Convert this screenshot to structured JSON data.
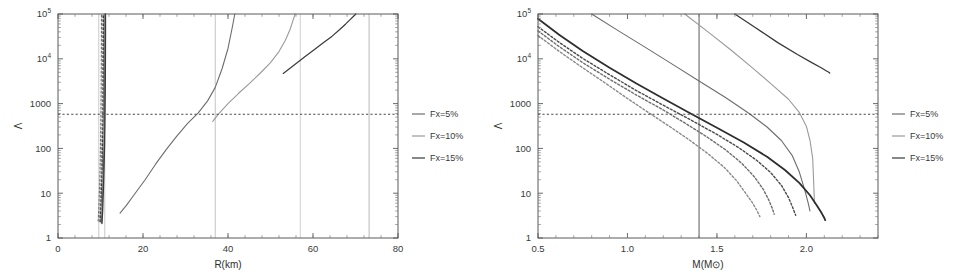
{
  "figure": {
    "background": "#ffffff",
    "panel_count": 2
  },
  "colors": {
    "fx5": "#6d6d6d",
    "fx10": "#9a9a9a",
    "fx15": "#3a3a3a",
    "frame": "#5a5a5a",
    "threshold": "#4a4a4a",
    "vline_faint": "#b5b5b5"
  },
  "legend": {
    "position": "right",
    "entries": [
      {
        "label": "Fx=5%",
        "color": "#6d6d6d"
      },
      {
        "label": "Fx=10%",
        "color": "#9a9a9a"
      },
      {
        "label": "Fx=15%",
        "color": "#3a3a3a"
      }
    ]
  },
  "chart_data": [
    {
      "type": "line",
      "panel": "left",
      "title": "",
      "xlabel": "R(km)",
      "ylabel": "Λ",
      "xlim": [
        0,
        80
      ],
      "ylim": [
        1,
        100000
      ],
      "yscale": "log",
      "xscale": "linear",
      "xticks": [
        0,
        20,
        40,
        60,
        80
      ],
      "xtick_labels": [
        "0",
        "20",
        "40",
        "60",
        "80"
      ],
      "yticks": [
        1,
        10,
        100,
        1000,
        10000,
        100000
      ],
      "ytick_labels": [
        "1",
        "10",
        "100",
        "1000",
        "10⁴",
        "10⁵"
      ],
      "grid": false,
      "annotations": {
        "threshold_line": {
          "y": 580,
          "style": "dotted",
          "label": "Λ=580"
        },
        "vertical_lines": [
          {
            "x": 9.6,
            "color": "#c2c2c2"
          },
          {
            "x": 11.0,
            "color": "#c2c2c2"
          },
          {
            "x": 37.0,
            "color": "#bdbdbd"
          },
          {
            "x": 57.0,
            "color": "#cccccc"
          },
          {
            "x": 73.2,
            "color": "#b0b0b0"
          }
        ]
      },
      "series": [
        {
          "name": "Fx=5% solid",
          "color": "#6d6d6d",
          "style": "solid",
          "width": 1.1,
          "x": [
            14.6,
            16.0,
            18.0,
            20.5,
            23.0,
            25.5,
            28.0,
            30.5,
            33.0,
            35.2,
            37.0,
            38.6,
            40.0,
            41.0,
            41.6
          ],
          "y": [
            3.6,
            5.2,
            9.5,
            20,
            45,
            95,
            190,
            360,
            620,
            1150,
            2300,
            6000,
            17000,
            50000,
            100000
          ]
        },
        {
          "name": "Fx=10% solid",
          "color": "#9a9a9a",
          "style": "solid",
          "width": 1.1,
          "x": [
            36.4,
            38.0,
            40.0,
            42.5,
            45.0,
            47.5,
            50.0,
            52.0,
            53.5,
            54.6,
            55.3,
            55.8
          ],
          "y": [
            400,
            620,
            1000,
            1700,
            2800,
            4700,
            8200,
            14500,
            26000,
            45000,
            72000,
            100000
          ]
        },
        {
          "name": "Fx=15% solid",
          "color": "#3a3a3a",
          "style": "solid",
          "width": 1.2,
          "x": [
            53.0,
            55.5,
            58.0,
            60.5,
            62.5,
            64.5,
            66.3,
            67.7,
            68.8,
            69.6,
            70.1
          ],
          "y": [
            4700,
            7200,
            11000,
            16500,
            23000,
            32000,
            45000,
            60000,
            76000,
            90000,
            100000
          ]
        },
        {
          "name": "Fx=5% compact branch",
          "color": "#6d6d6d",
          "style": "solid",
          "width": 1.2,
          "x": [
            10.2,
            10.35,
            10.5,
            10.65,
            10.8,
            10.9,
            10.95,
            10.98,
            11.0,
            11.0
          ],
          "y": [
            2.2,
            4,
            10,
            30,
            110,
            500,
            2200,
            11000,
            45000,
            100000
          ]
        },
        {
          "name": "Fx=10% compact branch",
          "color": "#9a9a9a",
          "style": "solid",
          "width": 1.0,
          "x": [
            10.0,
            10.15,
            10.3,
            10.45,
            10.6,
            10.7,
            10.76,
            10.8,
            10.82,
            10.82
          ],
          "y": [
            2.3,
            4.2,
            10.5,
            32,
            115,
            520,
            2300,
            11500,
            46000,
            100000
          ]
        },
        {
          "name": "Fx=15% compact branch",
          "color": "#3a3a3a",
          "style": "solid",
          "width": 1.3,
          "x": [
            10.35,
            10.5,
            10.65,
            10.8,
            10.95,
            11.05,
            11.12,
            11.16,
            11.18,
            11.18
          ],
          "y": [
            2.1,
            3.9,
            9.8,
            29,
            108,
            490,
            2150,
            10800,
            44000,
            100000
          ]
        },
        {
          "name": "Fx=5% compact dotted",
          "color": "#6d6d6d",
          "style": "dotted",
          "width": 1.1,
          "x": [
            9.45,
            9.6,
            9.75,
            9.9,
            10.0,
            10.1,
            10.16,
            10.2,
            10.22,
            10.22
          ],
          "y": [
            2.4,
            4.5,
            11,
            34,
            120,
            540,
            2400,
            12000,
            48000,
            100000
          ]
        },
        {
          "name": "Fx=10% compact dotted",
          "color": "#9a9a9a",
          "style": "dotted",
          "width": 1.1,
          "x": [
            9.7,
            9.85,
            10.0,
            10.15,
            10.27,
            10.37,
            10.43,
            10.47,
            10.49,
            10.49
          ],
          "y": [
            2.35,
            4.3,
            10.7,
            33,
            118,
            530,
            2350,
            11800,
            47000,
            100000
          ]
        },
        {
          "name": "Fx=15% compact dotted",
          "color": "#3a3a3a",
          "style": "dotted",
          "width": 1.1,
          "x": [
            9.9,
            10.05,
            10.2,
            10.35,
            10.47,
            10.57,
            10.63,
            10.67,
            10.69,
            10.69
          ],
          "y": [
            2.3,
            4.2,
            10.4,
            32,
            115,
            520,
            2300,
            11500,
            46000,
            100000
          ]
        }
      ]
    },
    {
      "type": "line",
      "panel": "right",
      "title": "",
      "xlabel": "M(M⊙)",
      "ylabel": "Λ",
      "xlim": [
        0.5,
        2.4
      ],
      "ylim": [
        1,
        100000
      ],
      "yscale": "log",
      "xscale": "linear",
      "xticks": [
        0.5,
        1.0,
        1.5,
        2.0
      ],
      "xtick_labels": [
        "0.5",
        "1.0",
        "1.5",
        "2.0"
      ],
      "yticks": [
        1,
        10,
        100,
        1000,
        10000,
        100000
      ],
      "ytick_labels": [
        "1",
        "10",
        "100",
        "1000",
        "10⁴",
        "10⁵"
      ],
      "grid": false,
      "annotations": {
        "threshold_line": {
          "y": 580,
          "style": "dotted",
          "label": "Λ=580"
        },
        "vertical_lines": [
          {
            "x": 1.4,
            "color": "#4a4a4a"
          }
        ]
      },
      "series": [
        {
          "name": "Fx=5% upper",
          "color": "#6d6d6d",
          "style": "solid",
          "width": 1.1,
          "x": [
            0.8,
            0.95,
            1.1,
            1.25,
            1.4,
            1.55,
            1.68,
            1.78,
            1.86,
            1.92,
            1.96,
            1.99,
            2.01,
            2.02
          ],
          "y": [
            100000,
            42000,
            18000,
            7600,
            3200,
            1350,
            600,
            300,
            150,
            70,
            30,
            12,
            6,
            4
          ]
        },
        {
          "name": "Fx=10% upper",
          "color": "#9a9a9a",
          "style": "solid",
          "width": 1.1,
          "x": [
            1.32,
            1.45,
            1.58,
            1.7,
            1.82,
            1.9,
            1.96,
            2.0,
            2.02,
            2.035,
            2.04,
            2.045
          ],
          "y": [
            100000,
            40000,
            15500,
            6200,
            2400,
            1250,
            640,
            310,
            150,
            60,
            20,
            6
          ]
        },
        {
          "name": "Fx=15% upper",
          "color": "#3a3a3a",
          "style": "solid",
          "width": 1.3,
          "x": [
            1.6,
            1.72,
            1.84,
            1.95,
            2.03,
            2.08,
            2.11,
            2.125,
            2.13
          ],
          "y": [
            100000,
            48000,
            23000,
            12500,
            8200,
            6400,
            5400,
            5000,
            4800
          ]
        },
        {
          "name": "Fx=15% lower solid",
          "color": "#2e2e2e",
          "style": "solid",
          "width": 1.8,
          "x": [
            0.5,
            0.62,
            0.75,
            0.9,
            1.05,
            1.2,
            1.35,
            1.5,
            1.65,
            1.78,
            1.88,
            1.96,
            2.02,
            2.06,
            2.085,
            2.1,
            2.105
          ],
          "y": [
            78000,
            34000,
            15000,
            6300,
            2800,
            1300,
            610,
            290,
            135,
            65,
            33,
            17,
            9,
            5.2,
            3.6,
            2.8,
            2.5
          ]
        },
        {
          "name": "Fx=15% lower dotted",
          "color": "#4a4a4a",
          "style": "dotted",
          "width": 1.4,
          "x": [
            0.5,
            0.62,
            0.75,
            0.9,
            1.05,
            1.2,
            1.35,
            1.5,
            1.62,
            1.72,
            1.8,
            1.86,
            1.9,
            1.925,
            1.94
          ],
          "y": [
            52000,
            23000,
            10200,
            4400,
            1950,
            920,
            440,
            205,
            105,
            55,
            29,
            15,
            8,
            4.6,
            3.2
          ]
        },
        {
          "name": "Fx=10% lower dotted",
          "color": "#6e6e6e",
          "style": "dotted",
          "width": 1.4,
          "x": [
            0.5,
            0.62,
            0.75,
            0.9,
            1.05,
            1.2,
            1.32,
            1.44,
            1.55,
            1.64,
            1.71,
            1.76,
            1.79,
            1.81,
            1.82
          ],
          "y": [
            42000,
            18500,
            8200,
            3500,
            1550,
            720,
            370,
            185,
            92,
            46,
            23,
            12,
            7,
            4.5,
            3.4
          ]
        },
        {
          "name": "Fx=5% lower dotted",
          "color": "#8a8a8a",
          "style": "dotted",
          "width": 1.4,
          "x": [
            0.5,
            0.62,
            0.75,
            0.88,
            1.0,
            1.12,
            1.24,
            1.35,
            1.45,
            1.54,
            1.61,
            1.66,
            1.7,
            1.725,
            1.74
          ],
          "y": [
            33000,
            14500,
            6300,
            2800,
            1300,
            620,
            300,
            150,
            76,
            38,
            19,
            10,
            6,
            4.0,
            3.0
          ]
        }
      ]
    }
  ]
}
